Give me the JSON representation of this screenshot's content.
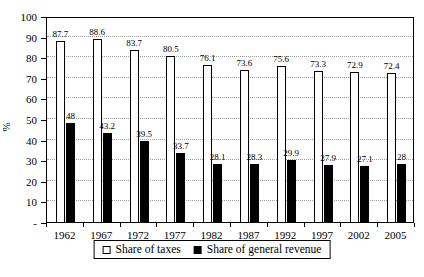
{
  "chart_data": {
    "type": "bar",
    "title": "",
    "xlabel": "",
    "ylabel": "%",
    "ylim": [
      0,
      100
    ],
    "ytick_step": 10,
    "ytick_labels": [
      "-",
      "10",
      "20",
      "30",
      "40",
      "50",
      "60",
      "70",
      "80",
      "90",
      "100"
    ],
    "grid": "horizontal-dotted",
    "grid_color": "#9a9a9a",
    "legend_position": "bottom",
    "categories": [
      "1962",
      "1967",
      "1972",
      "1977",
      "1982",
      "1987",
      "1992",
      "1997",
      "2002",
      "2005"
    ],
    "series": [
      {
        "name": "Share of taxes",
        "color": "#ffffff",
        "border_color": "#000000",
        "values": [
          87.7,
          88.6,
          83.7,
          80.5,
          76.1,
          73.6,
          75.6,
          73.3,
          72.9,
          72.4
        ]
      },
      {
        "name": "Share of general revenue",
        "color": "#000000",
        "values": [
          48,
          43.2,
          39.5,
          33.7,
          28.1,
          28.3,
          29.9,
          27.9,
          27.1,
          28
        ]
      }
    ]
  }
}
